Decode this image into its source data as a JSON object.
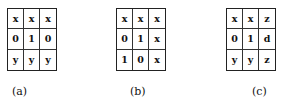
{
  "figures": [
    {
      "id": "a",
      "caption": "(a)",
      "cells": [
        [
          "x",
          "x",
          "x"
        ],
        [
          "0",
          "1",
          "0"
        ],
        [
          "y",
          "y",
          "y"
        ]
      ]
    },
    {
      "id": "b",
      "caption": "(b)",
      "cells": [
        [
          "x",
          "x",
          "x"
        ],
        [
          "0",
          "1",
          "x"
        ],
        [
          "1",
          "0",
          "x"
        ]
      ]
    },
    {
      "id": "c",
      "caption": "(c)",
      "cells": [
        [
          "x",
          "x",
          "z"
        ],
        [
          "0",
          "1",
          "d"
        ],
        [
          "y",
          "y",
          "z"
        ]
      ]
    }
  ]
}
